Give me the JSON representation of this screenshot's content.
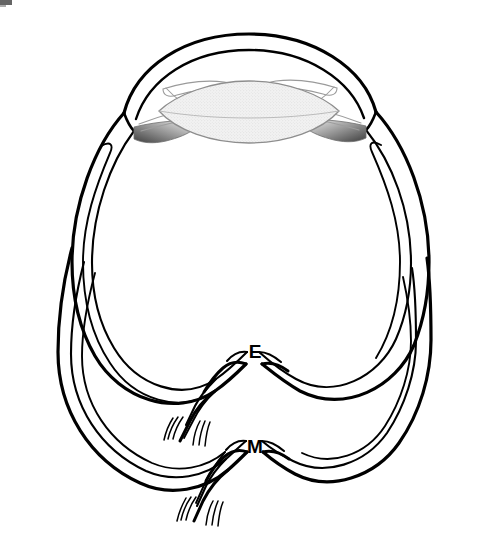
{
  "figure": {
    "kind": "anatomical-line-drawing",
    "background_color": "#ffffff",
    "ink_color": "#000000",
    "width": 483,
    "height": 549
  },
  "labels": [
    {
      "id": "E",
      "text": "E",
      "x": 255,
      "y": 358,
      "refers_to": "upper-optic-nerve-exit"
    },
    {
      "id": "M",
      "text": "M",
      "x": 255,
      "y": 453,
      "refers_to": "lower-optic-nerve-exit"
    }
  ],
  "structures": {
    "cornea": {
      "name": "cornea",
      "fill": "none",
      "stroke": "#000000"
    },
    "iris_left": {
      "name": "iris-left",
      "fill": "gradient-gray",
      "stroke": "#555555"
    },
    "iris_right": {
      "name": "iris-right",
      "fill": "gradient-gray",
      "stroke": "#555555"
    },
    "lens": {
      "name": "lens",
      "fill": "#e8e8e8",
      "stroke": "#8a8a8a"
    },
    "pupil_gap": {
      "name": "pupil-opening",
      "fill": "#ffffff",
      "stroke": "#9a9a9a"
    },
    "sclera_upper": {
      "name": "sclera-upper-globe",
      "fill": "none",
      "stroke": "#000000"
    },
    "sclera_lower": {
      "name": "sclera-lower-globe",
      "fill": "none",
      "stroke": "#000000"
    },
    "optic_nerve_upper": {
      "name": "optic-nerve-upper",
      "fill": "none",
      "stroke": "#000000"
    },
    "optic_nerve_lower": {
      "name": "optic-nerve-lower",
      "fill": "none",
      "stroke": "#000000"
    }
  },
  "artifact": {
    "name": "scan-artifact",
    "x": 0,
    "y": 0,
    "width": 13,
    "height": 6,
    "color": "#3a3a3a"
  },
  "colors": {
    "ink": "#000000",
    "lens_fill": "#e9e9e9",
    "lens_stroke": "#8d8d8d",
    "iris_dark": "#4a4a4a",
    "iris_light": "#d8d8d8",
    "thin_stroke": "#9a9a9a",
    "background": "#ffffff"
  }
}
